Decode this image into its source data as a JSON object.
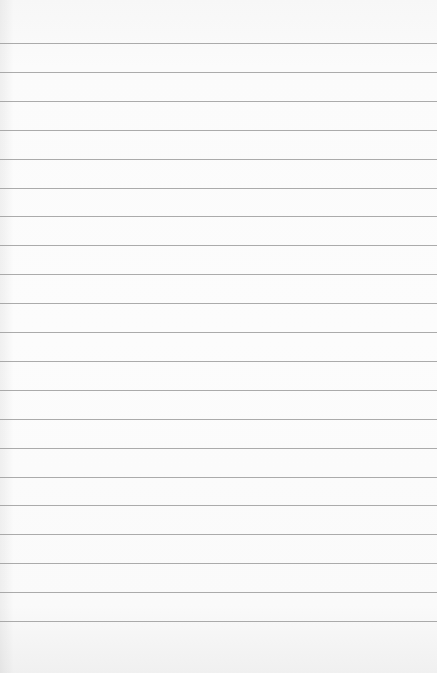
{
  "page": {
    "type": "lined-paper",
    "background_color": "#fbfbfb",
    "rule_color": "#9c9c9c",
    "rule_count": 21,
    "first_rule_y": 43,
    "rule_spacing": 28.9
  }
}
